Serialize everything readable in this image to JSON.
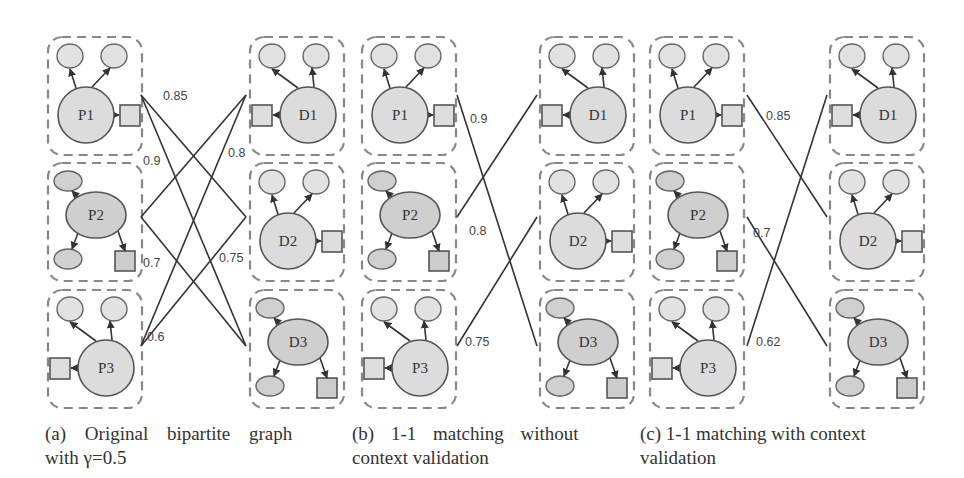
{
  "panels": [
    {
      "id": "a",
      "caption_line1": "(a)  Original  bipartite  graph",
      "caption_line2": "with γ=0.5",
      "left_nodes": [
        {
          "label": "P1",
          "kind": "circle"
        },
        {
          "label": "P2",
          "kind": "ellipse"
        },
        {
          "label": "P3",
          "kind": "circle-left"
        }
      ],
      "right_nodes": [
        {
          "label": "D1",
          "kind": "circle-left"
        },
        {
          "label": "D2",
          "kind": "circle"
        },
        {
          "label": "D3",
          "kind": "ellipse"
        }
      ],
      "edges": [
        {
          "from": "P1",
          "to": "D2",
          "weight": "0.85"
        },
        {
          "from": "P1",
          "to": "D3",
          "weight": "0.9"
        },
        {
          "from": "P2",
          "to": "D1",
          "weight": "0.8"
        },
        {
          "from": "P2",
          "to": "D3",
          "weight": "0.7"
        },
        {
          "from": "P3",
          "to": "D1",
          "weight": "0.6"
        },
        {
          "from": "P3",
          "to": "D2",
          "weight": "0.75"
        }
      ],
      "edge_labels": [
        "0.85",
        "0.9",
        "0.8",
        "0.7",
        "0.75",
        "0.6"
      ]
    },
    {
      "id": "b",
      "caption_line1": "(b)  1-1  matching  without",
      "caption_line2": "context validation",
      "left_nodes": [
        {
          "label": "P1",
          "kind": "circle"
        },
        {
          "label": "P2",
          "kind": "ellipse"
        },
        {
          "label": "P3",
          "kind": "circle-left"
        }
      ],
      "right_nodes": [
        {
          "label": "D1",
          "kind": "circle-left"
        },
        {
          "label": "D2",
          "kind": "circle"
        },
        {
          "label": "D3",
          "kind": "ellipse"
        }
      ],
      "edges": [
        {
          "from": "P1",
          "to": "D3",
          "weight": "0.9"
        },
        {
          "from": "P2",
          "to": "D1",
          "weight": "0.8"
        },
        {
          "from": "P3",
          "to": "D2",
          "weight": "0.75"
        }
      ],
      "edge_labels": [
        "0.9",
        "0.8",
        "0.75"
      ]
    },
    {
      "id": "c",
      "caption_line1": "(c) 1-1 matching with context",
      "caption_line2": "validation",
      "left_nodes": [
        {
          "label": "P1",
          "kind": "circle"
        },
        {
          "label": "P2",
          "kind": "ellipse"
        },
        {
          "label": "P3",
          "kind": "circle-left"
        }
      ],
      "right_nodes": [
        {
          "label": "D1",
          "kind": "circle-left"
        },
        {
          "label": "D2",
          "kind": "circle"
        },
        {
          "label": "D3",
          "kind": "ellipse"
        }
      ],
      "edges": [
        {
          "from": "P1",
          "to": "D2",
          "weight": "0.85"
        },
        {
          "from": "P2",
          "to": "D3",
          "weight": "0.7"
        },
        {
          "from": "P3",
          "to": "D1",
          "weight": "0.62"
        }
      ],
      "edge_labels": [
        "0.85",
        "0.7",
        "0.62"
      ]
    }
  ]
}
